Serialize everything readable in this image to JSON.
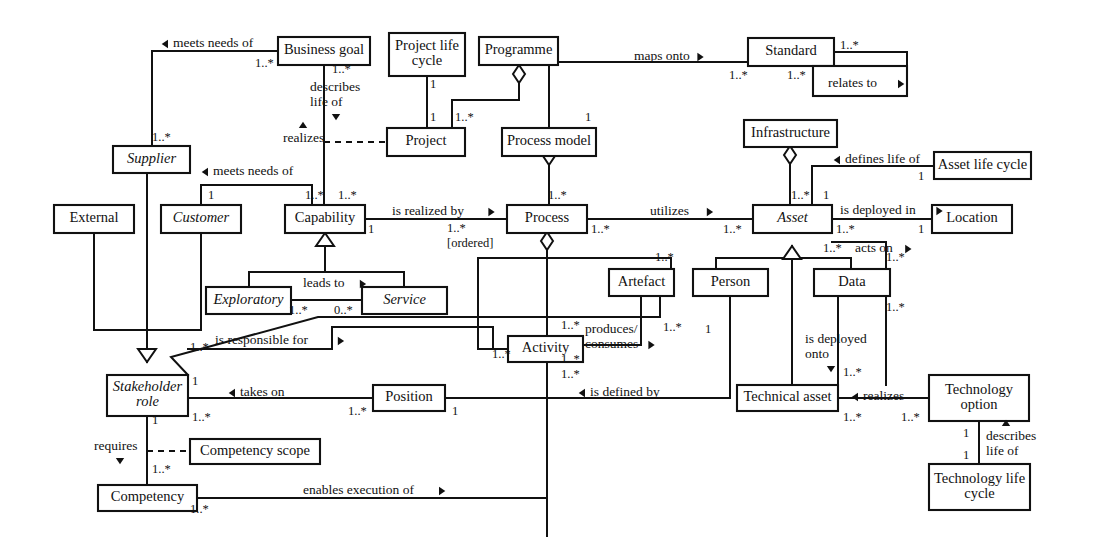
{
  "diagram": {
    "style": {
      "line_color": "#111111",
      "box_fill": "#ffffff",
      "text_color": "#111111"
    },
    "classes": [
      {
        "id": "business-goal",
        "label": "Business goal",
        "italic": false,
        "x": 278,
        "y": 37,
        "w": 92,
        "h": 28
      },
      {
        "id": "project-life-cycle",
        "label": "Project life\ncycle",
        "italic": false,
        "x": 389,
        "y": 33,
        "w": 76,
        "h": 43
      },
      {
        "id": "programme",
        "label": "Programme",
        "italic": false,
        "x": 479,
        "y": 37,
        "w": 79,
        "h": 28
      },
      {
        "id": "standard",
        "label": "Standard",
        "italic": false,
        "x": 748,
        "y": 38,
        "w": 86,
        "h": 28
      },
      {
        "id": "relates-to-box",
        "label": "",
        "italic": false,
        "x": 813,
        "y": 66,
        "w": 94,
        "h": 30
      },
      {
        "id": "project",
        "label": "Project",
        "italic": false,
        "x": 387,
        "y": 128,
        "w": 78,
        "h": 28
      },
      {
        "id": "process-model",
        "label": "Process model",
        "italic": false,
        "x": 502,
        "y": 128,
        "w": 94,
        "h": 28
      },
      {
        "id": "infrastructure",
        "label": "Infrastructure",
        "italic": false,
        "x": 744,
        "y": 120,
        "w": 93,
        "h": 27
      },
      {
        "id": "asset-life-cycle",
        "label": "Asset life cycle",
        "italic": false,
        "x": 934,
        "y": 152,
        "w": 97,
        "h": 27
      },
      {
        "id": "supplier",
        "label": "Supplier",
        "italic": true,
        "x": 113,
        "y": 146,
        "w": 77,
        "h": 27
      },
      {
        "id": "customer",
        "label": "Customer",
        "italic": true,
        "x": 161,
        "y": 205,
        "w": 80,
        "h": 28
      },
      {
        "id": "external",
        "label": "External",
        "italic": false,
        "x": 54,
        "y": 205,
        "w": 80,
        "h": 28
      },
      {
        "id": "capability",
        "label": "Capability",
        "italic": false,
        "x": 285,
        "y": 205,
        "w": 80,
        "h": 28
      },
      {
        "id": "process",
        "label": "Process",
        "italic": false,
        "x": 507,
        "y": 205,
        "w": 80,
        "h": 28
      },
      {
        "id": "asset",
        "label": "Asset",
        "italic": true,
        "x": 753,
        "y": 205,
        "w": 79,
        "h": 28
      },
      {
        "id": "location",
        "label": "Location",
        "italic": false,
        "x": 932,
        "y": 205,
        "w": 80,
        "h": 28
      },
      {
        "id": "exploratory",
        "label": "Exploratory",
        "italic": true,
        "x": 206,
        "y": 287,
        "w": 85,
        "h": 27
      },
      {
        "id": "service",
        "label": "Service",
        "italic": true,
        "x": 362,
        "y": 287,
        "w": 85,
        "h": 27
      },
      {
        "id": "artefact",
        "label": "Artefact",
        "italic": false,
        "x": 609,
        "y": 269,
        "w": 65,
        "h": 27
      },
      {
        "id": "person",
        "label": "Person",
        "italic": false,
        "x": 693,
        "y": 269,
        "w": 75,
        "h": 27
      },
      {
        "id": "data",
        "label": "Data",
        "italic": false,
        "x": 814,
        "y": 269,
        "w": 76,
        "h": 27
      },
      {
        "id": "activity",
        "label": "Activity",
        "italic": false,
        "x": 508,
        "y": 336,
        "w": 75,
        "h": 26
      },
      {
        "id": "stakeholder-role",
        "label": "Stakeholder\nrole",
        "italic": true,
        "x": 107,
        "y": 375,
        "w": 81,
        "h": 41
      },
      {
        "id": "position",
        "label": "Position",
        "italic": false,
        "x": 373,
        "y": 385,
        "w": 72,
        "h": 26
      },
      {
        "id": "technical-asset",
        "label": "Technical asset",
        "italic": false,
        "x": 737,
        "y": 385,
        "w": 101,
        "h": 26
      },
      {
        "id": "technology-option",
        "label": "Technology\noption",
        "italic": false,
        "x": 929,
        "y": 375,
        "w": 100,
        "h": 46
      },
      {
        "id": "competency-scope",
        "label": "Competency scope",
        "italic": false,
        "x": 190,
        "y": 439,
        "w": 130,
        "h": 25
      },
      {
        "id": "competency",
        "label": "Competency",
        "italic": false,
        "x": 98,
        "y": 485,
        "w": 99,
        "h": 26
      },
      {
        "id": "technology-life-cycle",
        "label": "Technology life\ncycle",
        "italic": false,
        "x": 929,
        "y": 464,
        "w": 101,
        "h": 46
      }
    ],
    "association_labels": [
      {
        "id": "meets-needs-of-1",
        "text": "meets needs of",
        "arrow": "left",
        "x": 173,
        "y": 44
      },
      {
        "id": "maps-onto",
        "text": "maps onto",
        "arrow": "right",
        "x": 634,
        "y": 57
      },
      {
        "id": "relates-to",
        "text": "relates to",
        "arrow": "right",
        "x": 828,
        "y": 84
      },
      {
        "id": "describes-life-of",
        "text": "describes\nlife of",
        "arrow": "down",
        "x": 310,
        "y": 88
      },
      {
        "id": "realizes",
        "text": "realizes",
        "arrow": "up",
        "x": 283,
        "y": 139
      },
      {
        "id": "defines-life-of",
        "text": "defines life of",
        "arrow": "left",
        "x": 845,
        "y": 160
      },
      {
        "id": "meets-needs-of-2",
        "text": "meets needs of",
        "arrow": "left",
        "x": 213,
        "y": 172
      },
      {
        "id": "is-realized-by",
        "text": "is realized by",
        "arrow": "right",
        "x": 392,
        "y": 212
      },
      {
        "id": "utilizes",
        "text": "utilizes",
        "arrow": "right",
        "x": 650,
        "y": 212
      },
      {
        "id": "is-deployed-in",
        "text": "is deployed in",
        "arrow": "right",
        "x": 840,
        "y": 211
      },
      {
        "id": "acts-on",
        "text": "acts on",
        "arrow": "right",
        "x": 855,
        "y": 249
      },
      {
        "id": "leads-to",
        "text": "leads to",
        "arrow": "right",
        "x": 303,
        "y": 284
      },
      {
        "id": "produces-consumes",
        "text": "produces/\nconsumes",
        "arrow": "right",
        "x": 585,
        "y": 330
      },
      {
        "id": "is-responsible-for",
        "text": "is responsible for",
        "arrow": "right",
        "x": 215,
        "y": 341
      },
      {
        "id": "is-deployed-onto",
        "text": "is deployed\nonto",
        "arrow": "down",
        "x": 805,
        "y": 340
      },
      {
        "id": "takes-on",
        "text": "takes on",
        "arrow": "left",
        "x": 240,
        "y": 393
      },
      {
        "id": "is-defined-by",
        "text": "is defined by",
        "arrow": "left",
        "x": 590,
        "y": 393
      },
      {
        "id": "realizes-2",
        "text": "realizes",
        "arrow": "left",
        "x": 863,
        "y": 397
      },
      {
        "id": "describes-life-of-2",
        "text": "describes\nlife of",
        "arrow": "up",
        "x": 986,
        "y": 437
      },
      {
        "id": "requires",
        "text": "requires",
        "arrow": "down",
        "x": 94,
        "y": 447
      },
      {
        "id": "enables-execution-of",
        "text": "enables execution of",
        "arrow": "right",
        "x": 303,
        "y": 491
      }
    ],
    "multiplicities": [
      {
        "id": "m-bg-left",
        "text": "1..*",
        "x": 255,
        "y": 64
      },
      {
        "id": "m-bg-down",
        "text": "1..*",
        "x": 332,
        "y": 70
      },
      {
        "id": "m-plc-1",
        "text": "1",
        "x": 430,
        "y": 85
      },
      {
        "id": "m-proj-top",
        "text": "1",
        "x": 430,
        "y": 118
      },
      {
        "id": "m-prog-1",
        "text": "1..*",
        "x": 455,
        "y": 118
      },
      {
        "id": "m-std-r1",
        "text": "1..*",
        "x": 840,
        "y": 46
      },
      {
        "id": "m-std-b1",
        "text": "1..*",
        "x": 729,
        "y": 76
      },
      {
        "id": "m-std-b2",
        "text": "1..*",
        "x": 787,
        "y": 76
      },
      {
        "id": "m-pm-1",
        "text": "1",
        "x": 585,
        "y": 118
      },
      {
        "id": "m-sup-1",
        "text": "1..*",
        "x": 152,
        "y": 138
      },
      {
        "id": "m-alc-1",
        "text": "1",
        "x": 918,
        "y": 177
      },
      {
        "id": "m-cust-1",
        "text": "1",
        "x": 208,
        "y": 196
      },
      {
        "id": "m-cap-t1",
        "text": "1..*",
        "x": 305,
        "y": 196
      },
      {
        "id": "m-cap-t2",
        "text": "1..*",
        "x": 338,
        "y": 196
      },
      {
        "id": "m-cap-r1",
        "text": "1",
        "x": 368,
        "y": 230
      },
      {
        "id": "m-proc-1",
        "text": "1..*",
        "x": 447,
        "y": 229
      },
      {
        "id": "m-proc-ord",
        "text": "[ordered]",
        "x": 447,
        "y": 244
      },
      {
        "id": "m-proc-t",
        "text": "1..*",
        "x": 548,
        "y": 196
      },
      {
        "id": "m-proc-r",
        "text": "1..*",
        "x": 591,
        "y": 230
      },
      {
        "id": "m-asset-l",
        "text": "1..*",
        "x": 723,
        "y": 230
      },
      {
        "id": "m-asset-t1",
        "text": "1..*",
        "x": 791,
        "y": 196
      },
      {
        "id": "m-asset-t2",
        "text": "1",
        "x": 823,
        "y": 196
      },
      {
        "id": "m-asset-r1",
        "text": "1..*",
        "x": 836,
        "y": 230
      },
      {
        "id": "m-acts-on-mult",
        "text": "1..*",
        "x": 823,
        "y": 249
      },
      {
        "id": "m-loc-1",
        "text": "1",
        "x": 918,
        "y": 230
      },
      {
        "id": "m-expl-1",
        "text": "1..*",
        "x": 289,
        "y": 311
      },
      {
        "id": "m-serv-0",
        "text": "0..*",
        "x": 334,
        "y": 311
      },
      {
        "id": "m-artefact-t",
        "text": "1..*",
        "x": 655,
        "y": 258
      },
      {
        "id": "m-artefact-b",
        "text": "1..*",
        "x": 663,
        "y": 328
      },
      {
        "id": "m-data-r1",
        "text": "1..*",
        "x": 886,
        "y": 258
      },
      {
        "id": "m-data-r2",
        "text": "1..*",
        "x": 886,
        "y": 308
      },
      {
        "id": "m-person-1",
        "text": "1",
        "x": 705,
        "y": 330
      },
      {
        "id": "m-act-t",
        "text": "1..*",
        "x": 561,
        "y": 326
      },
      {
        "id": "m-act-l",
        "text": "1..*",
        "x": 492,
        "y": 355
      },
      {
        "id": "m-act-b1",
        "text": "1..*",
        "x": 561,
        "y": 360
      },
      {
        "id": "m-act-b2",
        "text": "1..*",
        "x": 561,
        "y": 375
      },
      {
        "id": "m-sr-t",
        "text": "1..*",
        "x": 190,
        "y": 348
      },
      {
        "id": "m-sr-1",
        "text": "1",
        "x": 192,
        "y": 382
      },
      {
        "id": "m-sr-b",
        "text": "1..*",
        "x": 192,
        "y": 418
      },
      {
        "id": "m-sr-left1",
        "text": "1",
        "x": 152,
        "y": 421
      },
      {
        "id": "m-pos-l",
        "text": "1..*",
        "x": 348,
        "y": 412
      },
      {
        "id": "m-pos-r",
        "text": "1",
        "x": 452,
        "y": 412
      },
      {
        "id": "m-ta-t",
        "text": "1..*",
        "x": 843,
        "y": 373
      },
      {
        "id": "m-ta-b",
        "text": "1..*",
        "x": 843,
        "y": 418
      },
      {
        "id": "m-to-l",
        "text": "1..*",
        "x": 901,
        "y": 418
      },
      {
        "id": "m-to-b1",
        "text": "1",
        "x": 963,
        "y": 434
      },
      {
        "id": "m-tlc-t",
        "text": "1",
        "x": 963,
        "y": 456
      },
      {
        "id": "m-comp-req",
        "text": "1..*",
        "x": 152,
        "y": 470
      },
      {
        "id": "m-comp-b",
        "text": "1..*",
        "x": 190,
        "y": 510
      }
    ]
  }
}
